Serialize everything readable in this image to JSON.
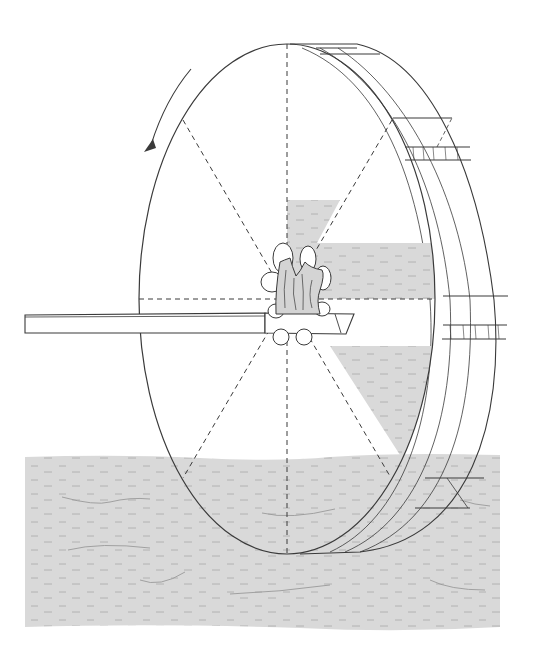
{
  "figure": {
    "title": "Water wheel illustration",
    "rotation_direction": "counter-clockwise",
    "spoke_count": 8,
    "colors": {
      "line": "#3a3a3a",
      "water_fill": "#d9d9d9",
      "water_dash": "#9a9a9a",
      "background": "#ffffff"
    }
  }
}
